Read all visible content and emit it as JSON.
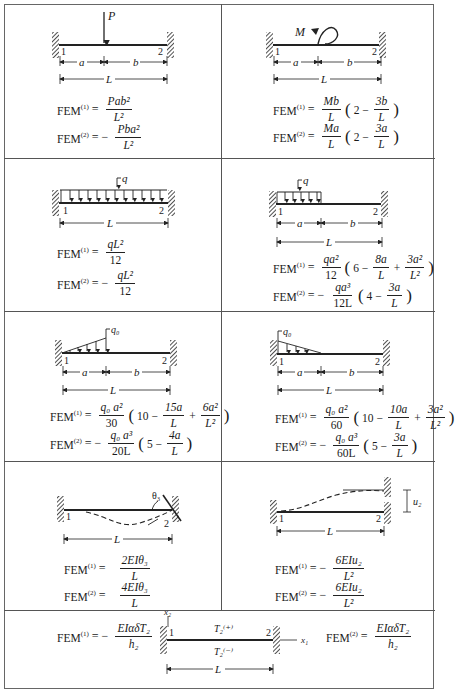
{
  "common": {
    "node1": "1",
    "node2": "2",
    "fem1_label": "FEM",
    "fem1_sup": "(1)",
    "fem2_label": "FEM",
    "fem2_sup": "(2)",
    "eq": "=",
    "eq_neg": "= −",
    "dim_a": "a",
    "dim_b": "b",
    "dim_L": "L"
  },
  "cells": [
    {
      "id": "point-load",
      "load_label": "P",
      "fem1": {
        "sign": "=",
        "num": "Pab²",
        "den": "L²"
      },
      "fem2": {
        "sign": "= −",
        "num": "Pba²",
        "den": "L²"
      }
    },
    {
      "id": "concentrated-moment",
      "load_label": "M",
      "fem1": {
        "sign": "=",
        "num": "Mb",
        "den": "L",
        "paren_pre": "2 −",
        "paren_num": "3b",
        "paren_den": "L"
      },
      "fem2": {
        "sign": "=",
        "num": "Ma",
        "den": "L",
        "paren_pre": "2 −",
        "paren_num": "3a",
        "paren_den": "L"
      }
    },
    {
      "id": "uniform-load-full",
      "load_label": "q",
      "fem1": {
        "sign": "=",
        "num": "qL²",
        "den": "12"
      },
      "fem2": {
        "sign": "= −",
        "num": "qL²",
        "den": "12"
      }
    },
    {
      "id": "uniform-load-partial",
      "load_label": "q",
      "fem1": {
        "sign": "=",
        "num": "qa²",
        "den": "12",
        "paren_pre": "6 −",
        "t1_num": "8a",
        "t1_den": "L",
        "op": "+",
        "t2_num": "3a²",
        "t2_den": "L²"
      },
      "fem2": {
        "sign": "= −",
        "num": "qa³",
        "den": "12L",
        "paren_pre": "4 −",
        "paren_num": "3a",
        "paren_den": "L"
      }
    },
    {
      "id": "triangular-load-increasing",
      "load_label": "q₀",
      "fem1": {
        "sign": "=",
        "num": "q₀ a²",
        "den": "30",
        "paren_pre": "10 −",
        "t1_num": "15a",
        "t1_den": "L",
        "op": "+",
        "t2_num": "6a²",
        "t2_den": "L²"
      },
      "fem2": {
        "sign": "= −",
        "num": "q₀ a³",
        "den": "20L",
        "paren_pre": "5 −",
        "paren_num": "4a",
        "paren_den": "L"
      }
    },
    {
      "id": "triangular-load-decreasing",
      "load_label": "q₀",
      "fem1": {
        "sign": "=",
        "num": "q₀ a²",
        "den": "60",
        "paren_pre": "10 −",
        "t1_num": "10a",
        "t1_den": "L",
        "op": "+",
        "t2_num": "3a²",
        "t2_den": "L²"
      },
      "fem2": {
        "sign": "= −",
        "num": "q₀ a³",
        "den": "60L",
        "paren_pre": "5 −",
        "paren_num": "3a",
        "paren_den": "L"
      }
    },
    {
      "id": "support-rotation",
      "load_label": "θ₃",
      "fem1": {
        "sign": "=",
        "num": "2EIθ₃",
        "den": "L"
      },
      "fem2": {
        "sign": "=",
        "num": "4EIθ₃",
        "den": "L"
      }
    },
    {
      "id": "support-settlement",
      "load_label": "u₂",
      "fem1": {
        "sign": "= −",
        "num": "6EIu₂",
        "den": "L²"
      },
      "fem2": {
        "sign": "= −",
        "num": "6EIu₂",
        "den": "L²"
      }
    },
    {
      "id": "thermal-gradient",
      "axis_x1": "x₁",
      "axis_x2": "x₂",
      "top_temp": "T₂⁽⁺⁾",
      "bottom_temp": "T₂⁽⁻⁾",
      "fem1": {
        "sign": "= −",
        "num": "EIαδT₂",
        "den": "h₂"
      },
      "fem2": {
        "sign": "=",
        "num": "EIαδT₂",
        "den": "h₂"
      }
    }
  ]
}
